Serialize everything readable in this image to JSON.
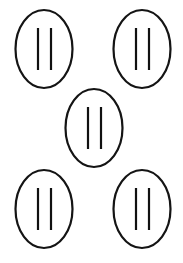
{
  "figure": {
    "width": 183,
    "height": 263,
    "background_color": "#ffffff",
    "stroke_color": "#141414",
    "bar_color": "#111111",
    "outline_width": 2.2,
    "bar_width": 2.2,
    "layout": "quincunx",
    "shape_count": 5,
    "bars_per_shape": 2,
    "shape_kind": "ellipse",
    "bar_kind": "vertical-line",
    "shapes": [
      {
        "name": "top-left",
        "cx": 44,
        "cy": 49,
        "rx": 28.5,
        "ry": 39,
        "bars": [
          {
            "x": 38,
            "y1": 28,
            "y2": 70
          },
          {
            "x": 51,
            "y1": 28,
            "y2": 70
          }
        ]
      },
      {
        "name": "top-right",
        "cx": 142,
        "cy": 49,
        "rx": 28.5,
        "ry": 39,
        "bars": [
          {
            "x": 136,
            "y1": 28,
            "y2": 70
          },
          {
            "x": 149,
            "y1": 28,
            "y2": 70
          }
        ]
      },
      {
        "name": "center",
        "cx": 94,
        "cy": 128,
        "rx": 28.5,
        "ry": 39,
        "bars": [
          {
            "x": 88,
            "y1": 107,
            "y2": 149
          },
          {
            "x": 101,
            "y1": 107,
            "y2": 149
          }
        ]
      },
      {
        "name": "bottom-left",
        "cx": 44,
        "cy": 209,
        "rx": 28.5,
        "ry": 39,
        "bars": [
          {
            "x": 38,
            "y1": 188,
            "y2": 230
          },
          {
            "x": 51,
            "y1": 188,
            "y2": 230
          }
        ]
      },
      {
        "name": "bottom-right",
        "cx": 142,
        "cy": 209,
        "rx": 28.5,
        "ry": 39,
        "bars": [
          {
            "x": 136,
            "y1": 188,
            "y2": 230
          },
          {
            "x": 149,
            "y1": 188,
            "y2": 230
          }
        ]
      }
    ]
  }
}
